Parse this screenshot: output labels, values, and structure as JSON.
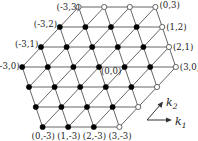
{
  "diagram": {
    "type": "triangular-lattice",
    "origin_px": [
      99,
      67
    ],
    "k1_step_px": [
      25.6,
      0
    ],
    "k2_step_px": [
      18.8,
      -20
    ],
    "node_radius": 2.6,
    "rows": [
      {
        "k2": 3,
        "k1_min": -3,
        "k1_max": 0
      },
      {
        "k2": 2,
        "k1_min": -3,
        "k1_max": 1
      },
      {
        "k2": 1,
        "k1_min": -3,
        "k1_max": 2
      },
      {
        "k2": 0,
        "k1_min": -3,
        "k1_max": 3
      },
      {
        "k2": -1,
        "k1_min": -2,
        "k1_max": 3
      },
      {
        "k2": -2,
        "k1_min": -1,
        "k1_max": 3
      },
      {
        "k2": -3,
        "k1_min": 0,
        "k1_max": 3
      }
    ],
    "open_nodes": [
      [
        -3,
        3
      ],
      [
        -2,
        3
      ],
      [
        -1,
        3
      ],
      [
        0,
        3
      ],
      [
        1,
        2
      ],
      [
        2,
        1
      ],
      [
        3,
        0
      ],
      [
        3,
        -1
      ],
      [
        3,
        -2
      ],
      [
        3,
        -3
      ]
    ],
    "labels": [
      {
        "k": [
          -3,
          3
        ],
        "text": "(-3,3)",
        "dx": -22,
        "dy": 3
      },
      {
        "k": [
          -3,
          2
        ],
        "text": "(-3,2)",
        "dx": -26,
        "dy": 0
      },
      {
        "k": [
          -3,
          1
        ],
        "text": "(-3,1)",
        "dx": -26,
        "dy": 0
      },
      {
        "k": [
          -3,
          0
        ],
        "text": "(-3,0)",
        "dx": -26,
        "dy": 2
      },
      {
        "k": [
          0,
          3
        ],
        "text": "(0,3)",
        "dx": 4,
        "dy": 1
      },
      {
        "k": [
          1,
          2
        ],
        "text": "(1,2)",
        "dx": 4,
        "dy": 3
      },
      {
        "k": [
          2,
          1
        ],
        "text": "(2,1)",
        "dx": 4,
        "dy": 3
      },
      {
        "k": [
          3,
          0
        ],
        "text": "(3,0)",
        "dx": 4,
        "dy": 3
      },
      {
        "k": [
          0,
          0
        ],
        "text": "(0,0)",
        "dx": 2,
        "dy": 7
      },
      {
        "k": [
          0,
          -3
        ],
        "text": "(0,-3)",
        "dx": -11,
        "dy": 12
      },
      {
        "k": [
          1,
          -3
        ],
        "text": "(1,-3)",
        "dx": -11,
        "dy": 12
      },
      {
        "k": [
          2,
          -3
        ],
        "text": "(2,-3)",
        "dx": -11,
        "dy": 12
      },
      {
        "k": [
          3,
          -3
        ],
        "text": "(3,-3)",
        "dx": -11,
        "dy": 12
      }
    ],
    "axes": {
      "k1": {
        "label": "k",
        "sub": "1"
      },
      "k2": {
        "label": "k",
        "sub": "2"
      }
    },
    "colors": {
      "edge": "#555555",
      "filled_node": "#000000",
      "open_node_fill": "#ffffff"
    }
  }
}
